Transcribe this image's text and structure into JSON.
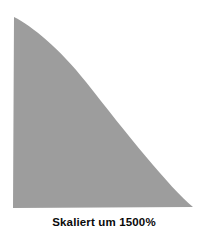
{
  "figure": {
    "caption": "Skaliert um 1500%",
    "background_color": "#ffffff",
    "shape": {
      "name": "scaled-quarter-curve-wedge",
      "fill_color": "#9d9d9d",
      "stroke": "none",
      "apex": {
        "x": 14,
        "y": 17
      },
      "bottom_left": {
        "x": 13,
        "y": 208
      },
      "bottom_right": {
        "x": 193,
        "y": 207
      },
      "curve_points": [
        {
          "x": 14,
          "y": 17
        },
        {
          "x": 32,
          "y": 32
        },
        {
          "x": 58,
          "y": 64
        },
        {
          "x": 125,
          "y": 132
        },
        {
          "x": 163,
          "y": 176
        },
        {
          "x": 193,
          "y": 207
        }
      ],
      "path": "M 14 17 L 13 208 L 193 207 C 170 188 126 133 86 82 C 60 49 32 26 14 17 Z"
    }
  },
  "scale": {
    "value": 1500,
    "unit": "%",
    "label_prefix": "Skaliert um"
  }
}
